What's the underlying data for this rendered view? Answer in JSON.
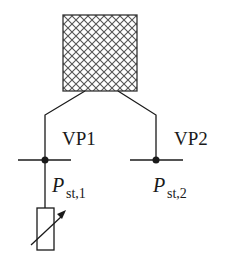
{
  "diagram": {
    "labels": {
      "vp1": "VP1",
      "vp2": "VP2",
      "pst1_main": "P",
      "pst1_sub": "st,1",
      "pst2_main": "P",
      "pst2_sub": "st,2"
    },
    "colors": {
      "line": "#1a1a1a",
      "hatch": "#555555",
      "background": "#ffffff"
    }
  }
}
